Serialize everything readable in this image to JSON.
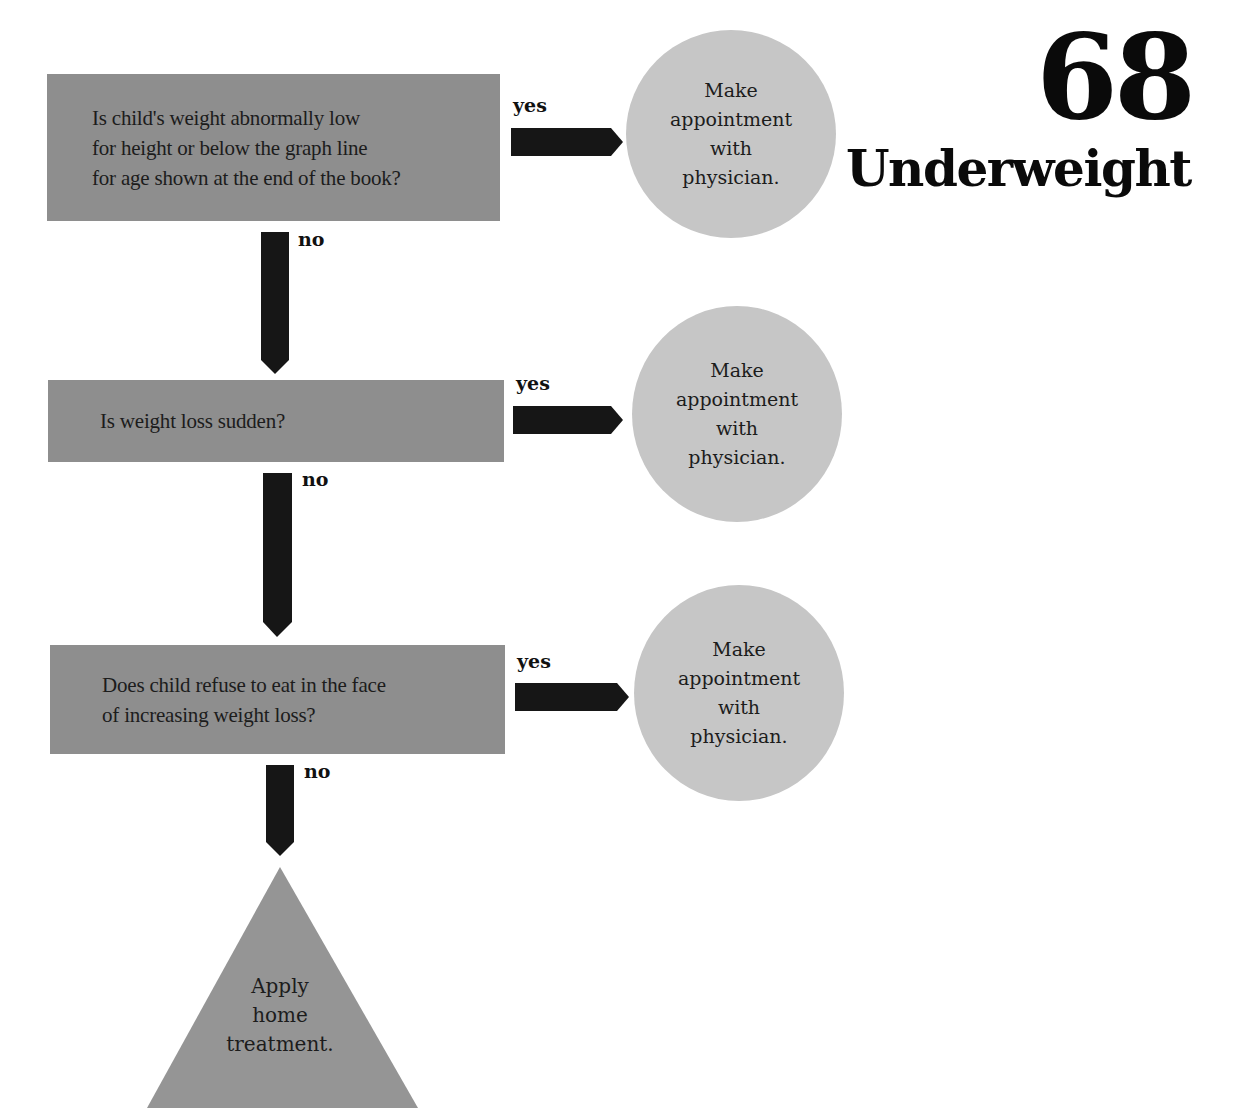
{
  "title": {
    "number": "68",
    "word": "Underweight"
  },
  "colors": {
    "question_box": "#8e8e8e",
    "outcome_circle": "#c6c6c6",
    "arrow": "#161616",
    "home_triangle": "#959595"
  },
  "questions": [
    {
      "lines": [
        "Is child's weight abnormally low",
        "for height or below the graph line",
        "for age shown at the end of the book?"
      ],
      "yes_label": "yes",
      "no_label": "no"
    },
    {
      "lines": [
        "Is weight loss sudden?"
      ],
      "yes_label": "yes",
      "no_label": "no"
    },
    {
      "lines": [
        "Does child refuse to eat in the face",
        "of increasing weight loss?"
      ],
      "yes_label": "yes",
      "no_label": "no"
    }
  ],
  "outcomes": [
    {
      "lines": [
        "Make",
        "appointment",
        "with",
        "physician."
      ]
    },
    {
      "lines": [
        "Make",
        "appointment",
        "with",
        "physician."
      ]
    },
    {
      "lines": [
        "Make",
        "appointment",
        "with",
        "physician."
      ]
    }
  ],
  "final": {
    "lines": [
      "Apply",
      "home",
      "treatment."
    ]
  }
}
